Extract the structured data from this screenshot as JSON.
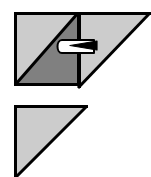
{
  "canvas": {
    "width": 151,
    "height": 177,
    "background": "#ffffff",
    "title": "Triangle transformation diagram"
  },
  "palette": {
    "light_gray": "#cccccc",
    "dark_gray": "#808080",
    "outline_black": "#000000",
    "arrow_fill": "#ffffff",
    "arrow_head": "#000000",
    "background_white": "#ffffff"
  },
  "shapes": {
    "upper_square": {
      "name": "square-split-diagonal",
      "x": 14,
      "y": 12,
      "width": 64,
      "height": 74,
      "outline": "#000000",
      "stroke_width": 3,
      "upper_left_triangle": {
        "name": "light-half",
        "fill": "#cccccc",
        "points": "14,12 78,12 14,86"
      },
      "lower_right_triangle": {
        "name": "dark-half",
        "fill": "#808080",
        "points": "78,12 78,86 14,86"
      },
      "diagonal": {
        "name": "diagonal-divider",
        "from": "14,86",
        "to": "78,12"
      }
    },
    "upper_right_triangle": {
      "name": "translated-triangle",
      "fill": "#cccccc",
      "outline": "#000000",
      "stroke_width": 3,
      "points": "78,12 150,12 78,88",
      "note": "right angle at top-left, hypotenuse from top-right down to bottom-left, clipped by right canvas edge"
    },
    "lower_triangle": {
      "name": "reference-triangle",
      "fill": "#cccccc",
      "outline": "#000000",
      "stroke_width": 3,
      "points": "14,105 88,105 14,177",
      "note": "right angle at top-left, clipped by bottom canvas edge"
    },
    "arrow": {
      "name": "translation-arrow",
      "direction": "right",
      "body_fill": "#ffffff",
      "body_outline": "#000000",
      "head_fill": "#000000",
      "x": 56,
      "y": 40,
      "width": 42,
      "height": 13,
      "label": ""
    }
  },
  "accessibility": {
    "description": "Geometric figure: a square divided by a diagonal into a light upper-left triangle and a dark lower-right triangle, a light right triangle translated to the right with an arrow indicating the rightward translation, and a separate light right triangle below."
  }
}
